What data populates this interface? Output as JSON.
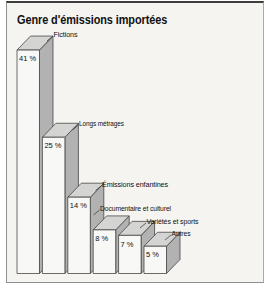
{
  "title": "Genre d'émissions importées",
  "chart_data": {
    "type": "bar",
    "projection": "3d-oblique",
    "title": "Genre d'émissions importées",
    "categories": [
      "Fictions",
      "Longs métrages",
      "Émissions enfantines",
      "Documentaire et culturel",
      "Variétés et sports",
      "Autres"
    ],
    "values": [
      41,
      25,
      14,
      8,
      7,
      5
    ],
    "value_labels": [
      "41 %",
      "25 %",
      "14 %",
      "8 %",
      "7 %",
      "5 %"
    ],
    "unit": "%",
    "ylim": [
      0,
      45
    ],
    "sorted": "descending",
    "grid": false,
    "legend": "none"
  },
  "colors": {
    "frame_border": "#8f8f8f",
    "frame_border_top": "#3d3d3d",
    "chart_background": "#f5f4f0",
    "bar_front": "#f8f8f6",
    "bar_side": "#b2b2b2",
    "bar_top": "#d4d4d2",
    "outline": "#3e3e3e",
    "text": "#111111"
  }
}
